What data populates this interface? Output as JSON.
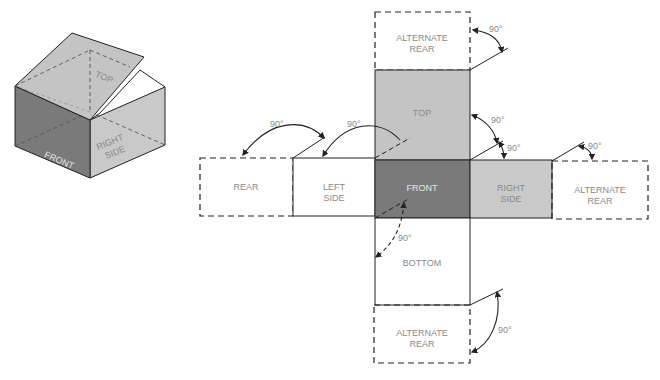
{
  "colors": {
    "top_fill": "#c4c4c4",
    "front_fill": "#7a7a7a",
    "side_fill": "#c9c9c9",
    "outline": "#222222",
    "label": "#8a8a8a",
    "label_on_dark": "#e6e6e6"
  },
  "isometric_box": {
    "faces": {
      "top": "TOP",
      "front": "FRONT",
      "right_line1": "RIGHT",
      "right_line2": "SIDE"
    }
  },
  "net": {
    "panels": {
      "alternate_rear_top": {
        "line1": "ALTERNATE",
        "line2": "REAR"
      },
      "top": {
        "label": "TOP"
      },
      "rear": {
        "label": "REAR"
      },
      "left_side": {
        "line1": "LEFT",
        "line2": "SIDE"
      },
      "front": {
        "label": "FRONT"
      },
      "right_side": {
        "line1": "RIGHT",
        "line2": "SIDE"
      },
      "alternate_rear_right": {
        "line1": "ALTERNATE",
        "line2": "REAR"
      },
      "bottom": {
        "label": "BOTTOM"
      },
      "alternate_rear_bottom": {
        "line1": "ALTERNATE",
        "line2": "REAR"
      }
    },
    "angle_labels": {
      "a1": "90°",
      "a2": "90°",
      "a3": "90°",
      "a4": "90°",
      "a5": "90°",
      "a6": "90°",
      "a7": "90°",
      "a8": "90°"
    }
  }
}
